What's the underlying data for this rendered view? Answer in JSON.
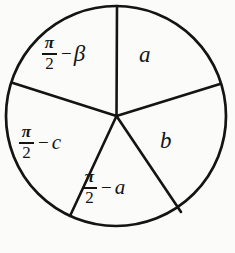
{
  "figure": {
    "name": "Napier's circle",
    "background_color": "#fbfbf9",
    "stroke_color": "#141414",
    "circle": {
      "cx": 116,
      "cy": 116,
      "r": 111,
      "stroke_width": 2.6
    },
    "sectors": [
      {
        "id": "top-right",
        "label": "a",
        "kind": "letter",
        "position": "upper right"
      },
      {
        "id": "right",
        "label": "b",
        "kind": "letter",
        "position": "right"
      },
      {
        "id": "bottom",
        "label": "π/2 − a",
        "kind": "expression",
        "numerator": "π",
        "denominator": "2",
        "operator": "−",
        "operand": "a",
        "position": "bottom"
      },
      {
        "id": "left",
        "label": "π/2 − c",
        "kind": "expression",
        "numerator": "π",
        "denominator": "2",
        "operator": "−",
        "operand": "c",
        "position": "lower left"
      },
      {
        "id": "top-left",
        "label": "π/2 − β",
        "kind": "expression",
        "numerator": "π",
        "denominator": "2",
        "operator": "−",
        "operand": "β",
        "position": "upper left"
      }
    ],
    "spokes": [
      {
        "id": "spoke-top",
        "x1": 116,
        "y1": 116,
        "x2": 117,
        "y2": 5
      },
      {
        "id": "spoke-upper-right",
        "x1": 116,
        "y1": 116,
        "x2": 219,
        "y2": 84
      },
      {
        "id": "spoke-lower-right",
        "x1": 116,
        "y1": 116,
        "x2": 181,
        "y2": 211
      },
      {
        "id": "spoke-lower-left",
        "x1": 116,
        "y1": 116,
        "x2": 71,
        "y2": 215
      },
      {
        "id": "spoke-upper-left",
        "x1": 116,
        "y1": 116,
        "x2": 14,
        "y2": 83
      }
    ]
  }
}
